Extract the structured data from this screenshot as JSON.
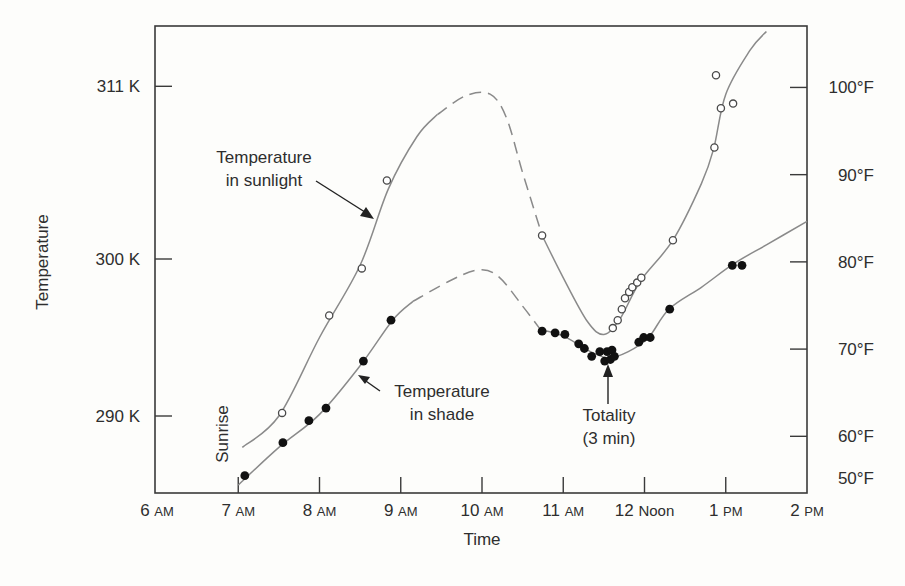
{
  "chart_data": {
    "type": "scatter",
    "title": "",
    "xlabel": "Time",
    "ylabel": "Temperature",
    "x_ticks": [
      {
        "value": 6,
        "label_num": "6",
        "label_unit": "AM"
      },
      {
        "value": 7,
        "label_num": "7",
        "label_unit": "AM"
      },
      {
        "value": 8,
        "label_num": "8",
        "label_unit": "AM"
      },
      {
        "value": 9,
        "label_num": "9",
        "label_unit": "AM"
      },
      {
        "value": 10,
        "label_num": "10",
        "label_unit": "AM"
      },
      {
        "value": 11,
        "label_num": "11",
        "label_unit": "AM"
      },
      {
        "value": 12,
        "label_num": "12",
        "label_unit": "Noon"
      },
      {
        "value": 13,
        "label_num": "1",
        "label_unit": "PM"
      },
      {
        "value": 14,
        "label_num": "2",
        "label_unit": "PM"
      }
    ],
    "y_left_ticks": [
      {
        "value": 311,
        "label": "311 K"
      },
      {
        "value": 300,
        "label": "300 K"
      },
      {
        "value": 290,
        "label": "290 K"
      }
    ],
    "y_right_ticks": [
      {
        "value_f": 100,
        "label": "100°F"
      },
      {
        "value_f": 90,
        "label": "90°F"
      },
      {
        "value_f": 80,
        "label": "80°F"
      },
      {
        "value_f": 70,
        "label": "70°F"
      },
      {
        "value_f": 60,
        "label": "60°F"
      },
      {
        "value_f": 50,
        "label": "50°F"
      }
    ],
    "xlim": [
      6,
      14
    ],
    "ylim_kelvin": [
      285,
      315.5
    ],
    "grid": false,
    "legend": "none (inline annotations)",
    "series": [
      {
        "name": "Temperature in sunlight",
        "marker": "open-circle",
        "points": [
          [
            7.54,
            290.2
          ],
          [
            8.12,
            296.4
          ],
          [
            8.52,
            299.4
          ],
          [
            8.83,
            305.0
          ],
          [
            10.74,
            301.5
          ],
          [
            11.61,
            295.6
          ],
          [
            11.67,
            296.1
          ],
          [
            11.72,
            296.8
          ],
          [
            11.76,
            297.5
          ],
          [
            11.81,
            297.9
          ],
          [
            11.85,
            298.2
          ],
          [
            11.91,
            298.5
          ],
          [
            11.96,
            298.8
          ],
          [
            12.35,
            301.2
          ],
          [
            12.86,
            307.1
          ],
          [
            12.88,
            311.7
          ],
          [
            12.94,
            309.6
          ],
          [
            13.09,
            309.9
          ]
        ],
        "curve_solid_1": [
          [
            7.05,
            288.0
          ],
          [
            7.5,
            290.0
          ],
          [
            8.0,
            295.0
          ],
          [
            8.5,
            299.6
          ],
          [
            8.85,
            304.5
          ],
          [
            9.2,
            307.8
          ],
          [
            9.45,
            309.2
          ]
        ],
        "curve_dashed": [
          [
            9.45,
            309.2
          ],
          [
            9.8,
            310.4
          ],
          [
            10.1,
            310.5
          ],
          [
            10.3,
            309.0
          ],
          [
            10.5,
            305.5
          ],
          [
            10.74,
            301.5
          ]
        ],
        "curve_solid_2": [
          [
            10.74,
            301.5
          ],
          [
            11.0,
            298.8
          ],
          [
            11.3,
            296.0
          ],
          [
            11.5,
            295.2
          ],
          [
            11.7,
            296.2
          ],
          [
            11.95,
            298.6
          ],
          [
            12.35,
            301.2
          ],
          [
            12.7,
            304.8
          ],
          [
            12.85,
            307.0
          ],
          [
            13.0,
            310.5
          ],
          [
            13.3,
            313.3
          ],
          [
            13.5,
            314.5
          ]
        ]
      },
      {
        "name": "Temperature in shade",
        "marker": "filled-circle",
        "points": [
          [
            7.08,
            286.2
          ],
          [
            7.55,
            288.3
          ],
          [
            7.87,
            289.7
          ],
          [
            8.08,
            290.5
          ],
          [
            8.54,
            293.5
          ],
          [
            8.88,
            296.1
          ],
          [
            10.74,
            295.4
          ],
          [
            10.9,
            295.3
          ],
          [
            11.02,
            295.2
          ],
          [
            11.19,
            294.6
          ],
          [
            11.26,
            294.3
          ],
          [
            11.35,
            293.8
          ],
          [
            11.45,
            294.1
          ],
          [
            11.54,
            294.1
          ],
          [
            11.6,
            294.2
          ],
          [
            11.51,
            293.5
          ],
          [
            11.58,
            293.6
          ],
          [
            11.63,
            293.8
          ],
          [
            11.93,
            294.7
          ],
          [
            11.99,
            295.0
          ],
          [
            12.07,
            295.0
          ],
          [
            12.31,
            296.8
          ],
          [
            13.08,
            299.6
          ],
          [
            13.2,
            299.6
          ]
        ],
        "curve_solid_1": [
          [
            7.0,
            285.6
          ],
          [
            7.5,
            288.0
          ],
          [
            8.0,
            290.1
          ],
          [
            8.5,
            293.2
          ],
          [
            8.9,
            296.1
          ],
          [
            9.15,
            297.3
          ]
        ],
        "curve_dashed": [
          [
            9.15,
            297.3
          ],
          [
            9.6,
            298.6
          ],
          [
            9.95,
            299.3
          ],
          [
            10.2,
            298.9
          ],
          [
            10.5,
            297.0
          ],
          [
            10.72,
            295.5
          ]
        ],
        "curve_solid_2": [
          [
            10.72,
            295.5
          ],
          [
            11.0,
            295.1
          ],
          [
            11.3,
            294.2
          ],
          [
            11.55,
            293.7
          ],
          [
            11.8,
            294.1
          ],
          [
            12.05,
            295.0
          ],
          [
            12.3,
            296.8
          ],
          [
            12.7,
            298.2
          ],
          [
            13.1,
            299.7
          ],
          [
            13.5,
            300.9
          ],
          [
            14.0,
            302.4
          ]
        ]
      }
    ],
    "annotations": [
      {
        "id": "sunlight",
        "lines": [
          "Temperature",
          "in sunlight"
        ],
        "arrow_to": [
          8.6,
          302.6
        ]
      },
      {
        "id": "shade",
        "lines": [
          "Temperature",
          "in shade"
        ],
        "arrow_to": [
          8.5,
          292.5
        ]
      },
      {
        "id": "totality",
        "lines": [
          "Totality",
          "(3 min)"
        ],
        "arrow_to": [
          11.55,
          293.3
        ]
      },
      {
        "id": "sunrise",
        "lines": [
          "Sunrise"
        ],
        "rotated": true
      }
    ]
  },
  "labels": {
    "x_title": "Time",
    "y_title": "Temperature",
    "sunrise": "Sunrise",
    "sunlight_line1": "Temperature",
    "sunlight_line2": "in sunlight",
    "shade_line1": "Temperature",
    "shade_line2": "in shade",
    "totality_line1": "Totality",
    "totality_line2": "(3 min)"
  }
}
